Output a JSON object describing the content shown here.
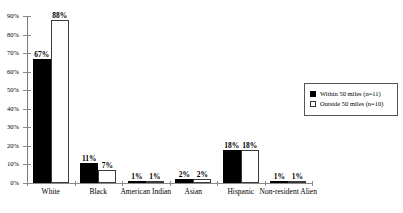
{
  "chart_data": {
    "type": "bar",
    "title": "",
    "xlabel": "",
    "ylabel": "",
    "ylim": [
      0,
      90
    ],
    "grid": false,
    "legend_position": "right",
    "categories": [
      "White",
      "Black",
      "American Indian",
      "Asian",
      "Hispanic",
      "Non-resident Alien"
    ],
    "ytick_labels": [
      "0%",
      "10%",
      "20%",
      "30%",
      "40%",
      "50%",
      "60%",
      "70%",
      "80%",
      "90%"
    ],
    "ytick_values": [
      0,
      10,
      20,
      30,
      40,
      50,
      60,
      70,
      80,
      90
    ],
    "series": [
      {
        "name": "Within 50 miles (n=11)",
        "color": "#000000",
        "values": [
          67,
          11,
          1,
          2,
          18,
          1
        ],
        "labels": [
          "67%",
          "11%",
          "1%",
          "2%",
          "18%",
          "1%"
        ]
      },
      {
        "name": "Outside 50 miles (n=10)",
        "color": "#ffffff",
        "values": [
          88,
          7,
          1,
          2,
          18,
          1
        ],
        "labels": [
          "88%",
          "7%",
          "1%",
          "2%",
          "18%",
          "1%"
        ]
      }
    ]
  },
  "legend": {
    "items": [
      {
        "label": "Within 50 miles (n=11)",
        "swatch": "filled-black"
      },
      {
        "label": "Outside 50 miles (n=10)",
        "swatch": "outline-white"
      }
    ]
  }
}
